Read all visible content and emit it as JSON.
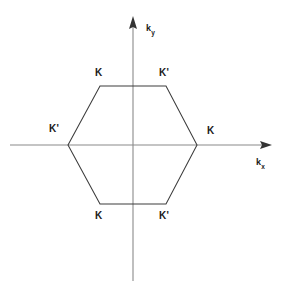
{
  "figure": {
    "background_color": "#ffffff",
    "width": 284,
    "height": 289,
    "axis_color": "#8a8a8a",
    "hexagon_color": "#3c3c3c",
    "label_color": "#1a1a1a"
  },
  "axes": {
    "x_axis": {
      "name": "kx-axis",
      "label_main": "k",
      "label_sub": "x",
      "label_x": 256,
      "label_y": 158,
      "line_x1": 10,
      "line_x2": 272,
      "line_y": 145,
      "arrow_at": "right"
    },
    "y_axis": {
      "name": "ky-axis",
      "label_main": "k",
      "label_sub": "y",
      "label_x": 146,
      "label_y": 24,
      "line_x": 133,
      "line_y1": 16,
      "line_y2": 281,
      "arrow_at": "top"
    },
    "origin": {
      "x": 133,
      "y": 145
    }
  },
  "chart_data": {
    "type": "scatter",
    "title": "",
    "subtitle": "",
    "xlabel": "kx",
    "ylabel": "ky",
    "grid": false,
    "legend": "none",
    "polygon": {
      "name": "brillouin-zone-hexagon",
      "closed": true,
      "vertices": [
        {
          "x": 68,
          "y": 145,
          "label": "K'"
        },
        {
          "x": 100,
          "y": 86,
          "label": "K"
        },
        {
          "x": 166,
          "y": 86,
          "label": "K'"
        },
        {
          "x": 197,
          "y": 145,
          "label": "K"
        },
        {
          "x": 166,
          "y": 204,
          "label": "K'"
        },
        {
          "x": 100,
          "y": 204,
          "label": "K"
        }
      ]
    },
    "points": [
      {
        "id": "k-top-left",
        "label": "K",
        "vertex_x": 100,
        "vertex_y": 86,
        "label_x": 95,
        "label_y": 68
      },
      {
        "id": "kprime-top-right",
        "label": "K'",
        "vertex_x": 166,
        "vertex_y": 86,
        "label_x": 159,
        "label_y": 68
      },
      {
        "id": "kprime-left",
        "label": "K'",
        "vertex_x": 68,
        "vertex_y": 145,
        "label_x": 49,
        "label_y": 124
      },
      {
        "id": "k-right",
        "label": "K",
        "vertex_x": 197,
        "vertex_y": 145,
        "label_x": 207,
        "label_y": 126
      },
      {
        "id": "k-bottom-left",
        "label": "K",
        "vertex_x": 100,
        "vertex_y": 204,
        "label_x": 95,
        "label_y": 211
      },
      {
        "id": "kprime-bottom-right",
        "label": "K'",
        "vertex_x": 166,
        "vertex_y": 204,
        "label_x": 159,
        "label_y": 211
      }
    ]
  }
}
